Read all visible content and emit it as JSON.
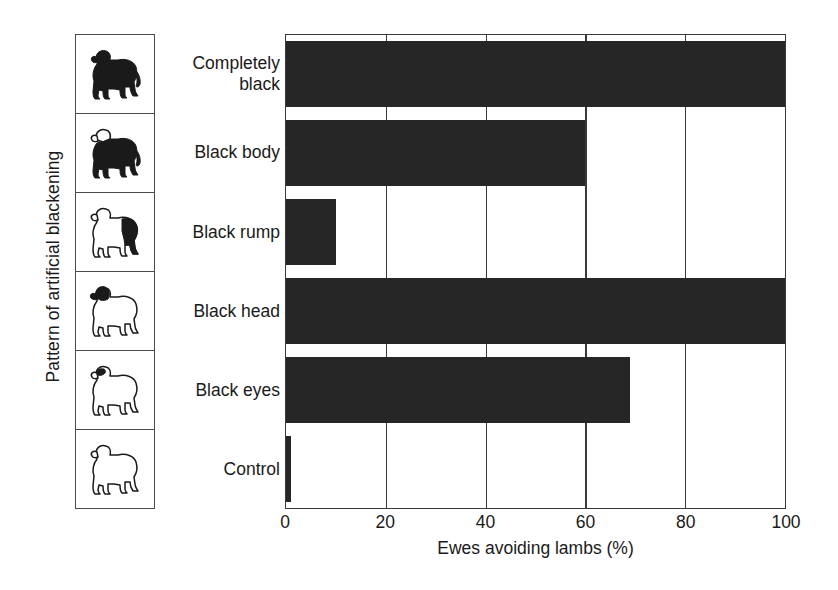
{
  "chart_data": {
    "type": "bar",
    "orientation": "horizontal",
    "title": "",
    "xlabel": "Ewes avoiding lambs (%)",
    "ylabel": "Pattern of artificial blackening",
    "categories": [
      "Completely black",
      "Black body",
      "Black rump",
      "Black head",
      "Black eyes",
      "Control"
    ],
    "values": [
      100,
      60,
      10,
      100,
      69,
      1
    ],
    "xlim": [
      0,
      100
    ],
    "xticks": [
      0,
      20,
      40,
      60,
      80,
      100
    ],
    "xtick_labels": [
      "0",
      "20",
      "40",
      "60",
      "80",
      "100"
    ],
    "grid": "vertical",
    "legend": "none",
    "bar_color": "#262626",
    "axis_color": "#3a3a3a"
  },
  "axes": {
    "y_title": "Pattern of artificial blackening",
    "x_title": "Ewes avoiding lambs (%)"
  },
  "categories": [
    {
      "label_lines": [
        "Completely",
        "black"
      ],
      "label": "Completely black",
      "value": 100,
      "icon": "lamb-completely-black-icon",
      "icon_desc": "lamb silhouette fully black"
    },
    {
      "label_lines": [
        "Black body"
      ],
      "label": "Black body",
      "value": 60,
      "icon": "lamb-black-body-icon",
      "icon_desc": "lamb with black body and white head"
    },
    {
      "label_lines": [
        "Black rump"
      ],
      "label": "Black rump",
      "value": 10,
      "icon": "lamb-black-rump-icon",
      "icon_desc": "white lamb with black rump"
    },
    {
      "label_lines": [
        "Black head"
      ],
      "label": "Black head",
      "value": 100,
      "icon": "lamb-black-head-icon",
      "icon_desc": "white lamb with black head"
    },
    {
      "label_lines": [
        "Black eyes"
      ],
      "label": "Black eyes",
      "value": 69,
      "icon": "lamb-black-eyes-icon",
      "icon_desc": "white lamb with black eye patch"
    },
    {
      "label_lines": [
        "Control"
      ],
      "label": "Control",
      "value": 1,
      "icon": "lamb-control-icon",
      "icon_desc": "plain white lamb outline"
    }
  ],
  "xticks": [
    {
      "label": "0",
      "value": 0
    },
    {
      "label": "20",
      "value": 20
    },
    {
      "label": "40",
      "value": 40
    },
    {
      "label": "60",
      "value": 60
    },
    {
      "label": "80",
      "value": 80
    },
    {
      "label": "100",
      "value": 100
    }
  ]
}
